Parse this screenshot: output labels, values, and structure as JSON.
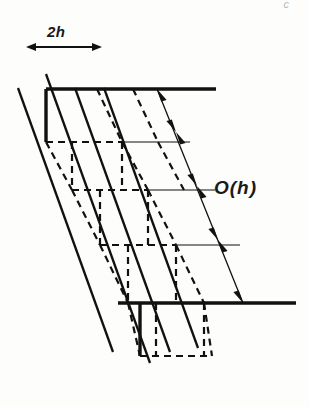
{
  "figure": {
    "background_color": "#fdfdfc",
    "ink_color": "#111111",
    "labels": {
      "spacing_horizontal": "2h",
      "spacing_diagonal": "O(h)",
      "corner_mark": "c"
    },
    "annotations": [
      {
        "name": "horizontal-extent",
        "text": "2h",
        "kind": "double-headed-arrow",
        "orientation": "horizontal",
        "x1": 36,
        "x2": 92,
        "y": 47
      },
      {
        "name": "diagonal-spacing-chain",
        "text": "O(h)",
        "kind": "dimension-chain",
        "orientation": "diagonal",
        "segments": 4,
        "start": [
          157,
          89
        ],
        "end": [
          243,
          303
        ]
      }
    ],
    "geometry": {
      "thick_lines": [
        {
          "name": "top-baseline",
          "x1": 46,
          "y1": 89,
          "x2": 216,
          "y2": 89
        },
        {
          "name": "bottom-baseline",
          "x1": 118,
          "y1": 303,
          "x2": 296,
          "y2": 303
        },
        {
          "name": "left-vertical-top",
          "x1": 46,
          "y1": 89,
          "x2": 46,
          "y2": 142
        },
        {
          "name": "left-vertical-bottom",
          "x1": 140,
          "y1": 303,
          "x2": 140,
          "y2": 356
        }
      ],
      "diagonals": {
        "count": 4,
        "slope_dx": 96,
        "slope_dy": 268,
        "x_offsets": [
          18,
          46,
          75,
          104
        ]
      },
      "thin_rules": {
        "count": 3,
        "y_values": [
          142,
          190,
          245
        ]
      },
      "dashed_cells": {
        "rows": 4,
        "cols": 2,
        "cell_width": 56,
        "cell_height": 53
      }
    }
  }
}
